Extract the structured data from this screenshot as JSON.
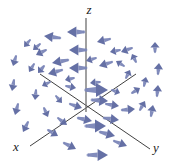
{
  "figure": {
    "width": 172,
    "height": 166,
    "background_color": "#ffffff"
  },
  "axes": {
    "origin": {
      "x": 86,
      "y": 101
    },
    "line_color": "#6e6e6e",
    "diagonal_color": "#2b2b2b",
    "z": {
      "label": "z",
      "label_pos": {
        "x": 89,
        "y": 14
      },
      "from": {
        "x": 86,
        "y": 18
      },
      "to": {
        "x": 86,
        "y": 112
      }
    },
    "x": {
      "label": "x",
      "label_pos": {
        "x": 16,
        "y": 151
      },
      "from": {
        "x": 136,
        "y": 74
      },
      "to": {
        "x": 30,
        "y": 146
      }
    },
    "y": {
      "label": "y",
      "label_pos": {
        "x": 156,
        "y": 152
      },
      "from": {
        "x": 40,
        "y": 74
      },
      "to": {
        "x": 150,
        "y": 149
      }
    }
  },
  "chart_data": {
    "type": "scatter",
    "xlabel": "x",
    "ylabel": "y",
    "zlabel": "z",
    "field_type": "rotational",
    "arrow_color": "#7b86b8",
    "arrow_color_dark": "#5d68a0",
    "arrow_count": 52,
    "vectors": [
      {
        "x": 84,
        "y": 32,
        "dx": -17,
        "dy": 0,
        "w": 2.4
      },
      {
        "x": 60,
        "y": 38,
        "dx": -16,
        "dy": -2,
        "w": 2.2
      },
      {
        "x": 110,
        "y": 39,
        "dx": -13,
        "dy": 3,
        "w": 2.0
      },
      {
        "x": 132,
        "y": 48,
        "dx": -11,
        "dy": 4,
        "w": 1.9
      },
      {
        "x": 46,
        "y": 50,
        "dx": -10,
        "dy": 5,
        "w": 1.9
      },
      {
        "x": 86,
        "y": 50,
        "dx": -17,
        "dy": 0,
        "w": 2.4
      },
      {
        "x": 68,
        "y": 60,
        "dx": -16,
        "dy": 3,
        "w": 2.2
      },
      {
        "x": 112,
        "y": 62,
        "dx": -13,
        "dy": 4,
        "w": 2.0
      },
      {
        "x": 86,
        "y": 68,
        "dx": -17,
        "dy": 0,
        "w": 2.4
      },
      {
        "x": 62,
        "y": 70,
        "dx": -14,
        "dy": 4,
        "w": 2.1
      },
      {
        "x": 44,
        "y": 66,
        "dx": -6,
        "dy": 7,
        "w": 1.9
      },
      {
        "x": 155,
        "y": 52,
        "dx": 0,
        "dy": -10,
        "w": 2.0
      },
      {
        "x": 158,
        "y": 74,
        "dx": 1,
        "dy": -11,
        "w": 2.0
      },
      {
        "x": 157,
        "y": 96,
        "dx": 1,
        "dy": -11,
        "w": 2.0
      },
      {
        "x": 151,
        "y": 116,
        "dx": 2,
        "dy": -11,
        "w": 2.0
      },
      {
        "x": 136,
        "y": 62,
        "dx": -4,
        "dy": -8,
        "w": 1.8
      },
      {
        "x": 126,
        "y": 78,
        "dx": 4,
        "dy": -8,
        "w": 1.8
      },
      {
        "x": 132,
        "y": 93,
        "dx": 8,
        "dy": -5,
        "w": 1.9
      },
      {
        "x": 122,
        "y": 110,
        "dx": 13,
        "dy": -1,
        "w": 2.1
      },
      {
        "x": 104,
        "y": 118,
        "dx": 15,
        "dy": 2,
        "w": 2.2
      },
      {
        "x": 86,
        "y": 90,
        "dx": 22,
        "dy": 0,
        "w": 3.0
      },
      {
        "x": 86,
        "y": 126,
        "dx": 20,
        "dy": 0,
        "w": 2.8
      },
      {
        "x": 100,
        "y": 132,
        "dx": 15,
        "dy": 4,
        "w": 2.2
      },
      {
        "x": 88,
        "y": 155,
        "dx": 20,
        "dy": 0,
        "w": 2.6
      },
      {
        "x": 64,
        "y": 143,
        "dx": 12,
        "dy": 6,
        "w": 2.1
      },
      {
        "x": 114,
        "y": 141,
        "dx": 13,
        "dy": 5,
        "w": 2.0
      },
      {
        "x": 16,
        "y": 56,
        "dx": -3,
        "dy": 10,
        "w": 1.9
      },
      {
        "x": 14,
        "y": 80,
        "dx": -2,
        "dy": 11,
        "w": 1.9
      },
      {
        "x": 18,
        "y": 104,
        "dx": -3,
        "dy": 11,
        "w": 1.9
      },
      {
        "x": 28,
        "y": 122,
        "dx": -5,
        "dy": 10,
        "w": 1.9
      },
      {
        "x": 36,
        "y": 90,
        "dx": -1,
        "dy": 10,
        "w": 1.8
      },
      {
        "x": 44,
        "y": 108,
        "dx": 4,
        "dy": 9,
        "w": 1.8
      },
      {
        "x": 58,
        "y": 118,
        "dx": 9,
        "dy": 7,
        "w": 1.9
      },
      {
        "x": 48,
        "y": 130,
        "dx": 10,
        "dy": 6,
        "w": 1.9
      },
      {
        "x": 70,
        "y": 104,
        "dx": 12,
        "dy": 4,
        "w": 2.0
      },
      {
        "x": 66,
        "y": 86,
        "dx": 10,
        "dy": 2,
        "w": 1.8
      },
      {
        "x": 74,
        "y": 78,
        "dx": -9,
        "dy": 2,
        "w": 1.8
      },
      {
        "x": 100,
        "y": 82,
        "dx": -10,
        "dy": 1,
        "w": 1.8
      },
      {
        "x": 112,
        "y": 90,
        "dx": 8,
        "dy": 3,
        "w": 1.8
      },
      {
        "x": 124,
        "y": 66,
        "dx": -8,
        "dy": -5,
        "w": 1.7
      },
      {
        "x": 50,
        "y": 82,
        "dx": -8,
        "dy": 4,
        "w": 1.7
      },
      {
        "x": 40,
        "y": 44,
        "dx": -7,
        "dy": 6,
        "w": 1.7
      },
      {
        "x": 96,
        "y": 58,
        "dx": -10,
        "dy": 3,
        "w": 1.8
      },
      {
        "x": 120,
        "y": 50,
        "dx": -10,
        "dy": 2,
        "w": 1.8
      },
      {
        "x": 78,
        "y": 118,
        "dx": 14,
        "dy": 3,
        "w": 2.1
      },
      {
        "x": 140,
        "y": 110,
        "dx": 5,
        "dy": -9,
        "w": 1.9
      },
      {
        "x": 34,
        "y": 64,
        "dx": -5,
        "dy": 8,
        "w": 1.7
      },
      {
        "x": 92,
        "y": 100,
        "dx": 16,
        "dy": 1,
        "w": 2.4
      },
      {
        "x": 56,
        "y": 96,
        "dx": 6,
        "dy": 7,
        "w": 1.7
      },
      {
        "x": 106,
        "y": 104,
        "dx": 13,
        "dy": 2,
        "w": 2.0
      },
      {
        "x": 144,
        "y": 86,
        "dx": 2,
        "dy": -9,
        "w": 1.8
      },
      {
        "x": 30,
        "y": 40,
        "dx": -6,
        "dy": 7,
        "w": 1.7
      }
    ]
  }
}
